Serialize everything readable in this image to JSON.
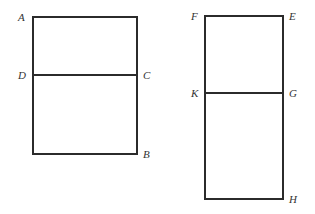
{
  "diagram": {
    "stroke_color": "#2b2b2b",
    "figures": [
      {
        "name": "rectangle-ABCD",
        "rect": {
          "x1": 33,
          "y1": 17,
          "x2": 137,
          "y2": 154
        },
        "divider": {
          "y": 75,
          "from": "D",
          "to": "C"
        },
        "labels": [
          {
            "text": "A",
            "x": 18,
            "y": 21
          },
          {
            "text": "D",
            "x": 18,
            "y": 79
          },
          {
            "text": "C",
            "x": 143,
            "y": 79
          },
          {
            "text": "B",
            "x": 143,
            "y": 158
          }
        ]
      },
      {
        "name": "rectangle-EFGHK",
        "rect": {
          "x1": 205,
          "y1": 16,
          "x2": 283,
          "y2": 199
        },
        "divider": {
          "y": 93,
          "from": "K",
          "to": "G"
        },
        "labels": [
          {
            "text": "F",
            "x": 191,
            "y": 20
          },
          {
            "text": "E",
            "x": 289,
            "y": 20
          },
          {
            "text": "K",
            "x": 191,
            "y": 97
          },
          {
            "text": "G",
            "x": 289,
            "y": 97
          },
          {
            "text": "H",
            "x": 289,
            "y": 203
          }
        ]
      }
    ]
  }
}
